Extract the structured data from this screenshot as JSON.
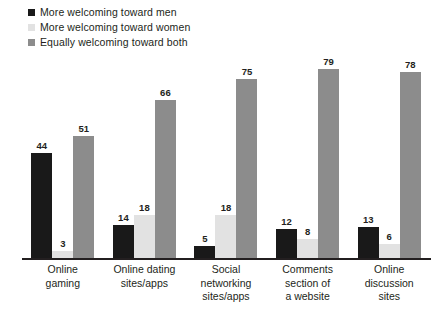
{
  "chart_data": {
    "type": "bar",
    "title": "",
    "subtitle": "",
    "xlabel": "",
    "ylabel": "",
    "ylim": [
      0,
      85
    ],
    "grid": false,
    "legend_position": "top-left",
    "orientation": "vertical",
    "grouping": "grouped",
    "value_suffix": "",
    "categories": [
      "Online\ngaming",
      "Online dating\nsites/apps",
      "Social\nnetworking\nsites/apps",
      "Comments\nsection of\na website",
      "Online\ndiscussion\nsites"
    ],
    "category_lines": [
      [
        "Online",
        "gaming"
      ],
      [
        "Online dating",
        "sites/apps"
      ],
      [
        "Social",
        "networking",
        "sites/apps"
      ],
      [
        "Comments",
        "section of",
        "a website"
      ],
      [
        "Online",
        "discussion",
        "sites"
      ]
    ],
    "series": [
      {
        "name": "More welcoming toward men",
        "color": "#191919",
        "values": [
          44,
          14,
          5,
          12,
          13
        ]
      },
      {
        "name": "More welcoming toward women",
        "color": "#e2e2e2",
        "values": [
          3,
          18,
          18,
          8,
          6
        ]
      },
      {
        "name": "Equally welcoming toward both",
        "color": "#8c8c8c",
        "values": [
          51,
          66,
          75,
          79,
          78
        ]
      }
    ]
  },
  "legend": {
    "items": [
      {
        "label": "More welcoming toward men",
        "color": "#191919",
        "swatch": "square-swatch"
      },
      {
        "label": "More welcoming toward women",
        "color": "#e2e2e2",
        "swatch": "square-swatch"
      },
      {
        "label": "Equally welcoming toward both",
        "color": "#8c8c8c",
        "swatch": "square-swatch"
      }
    ]
  },
  "axis": {
    "baseline_color": "#231f20"
  }
}
